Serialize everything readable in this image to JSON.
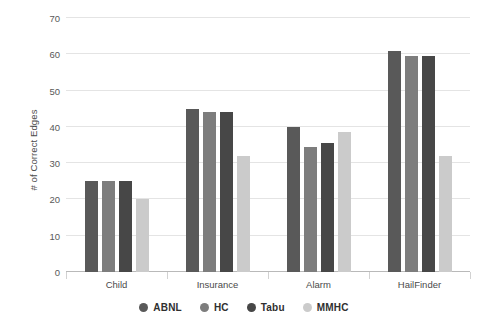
{
  "chart_data": {
    "type": "bar",
    "title": "",
    "subtitle": "",
    "xlabel": "",
    "ylabel": "# of Correct Edges",
    "categories": [
      "Child",
      "Insurance",
      "Alarm",
      "HailFinder"
    ],
    "series": [
      {
        "name": "ABNL",
        "color": "#595959",
        "values": [
          25,
          45,
          40,
          61
        ]
      },
      {
        "name": "HC",
        "color": "#7d7d7d",
        "values": [
          25,
          44,
          34.5,
          59.5
        ]
      },
      {
        "name": "Tabu",
        "color": "#474747",
        "values": [
          25,
          44,
          35.5,
          59.5
        ]
      },
      {
        "name": "MMHC",
        "color": "#cbcbcb",
        "values": [
          20,
          32,
          38.5,
          32
        ]
      }
    ],
    "ylim": [
      0,
      70
    ],
    "yticks": [
      0,
      10,
      20,
      30,
      40,
      50,
      60,
      70
    ],
    "ytick_labels": [
      "0",
      "10",
      "20",
      "30",
      "40",
      "50",
      "60",
      "70"
    ],
    "grid": "horizontal",
    "legend_position": "bottom",
    "legend_entries": [
      "ABNL",
      "HC",
      "Tabu",
      "MMHC"
    ],
    "background_color": "#ffffff",
    "gridline_color": "#e4e4e4",
    "axis_color": "#b9b9b9",
    "tick_label_color": "#595959"
  }
}
